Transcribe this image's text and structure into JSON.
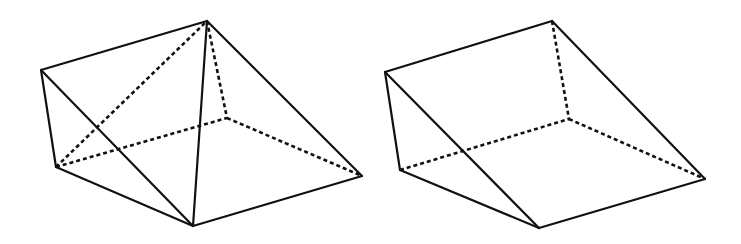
{
  "figures": [
    {
      "id": "left-solid",
      "description": "Triangular prism dissected by two diagonals",
      "vertices": {
        "A": [
          41,
          70
        ],
        "B": [
          207,
          21
        ],
        "C": [
          56,
          167
        ],
        "D": [
          193,
          226
        ],
        "E": [
          362,
          176
        ],
        "F": [
          227,
          118
        ]
      },
      "solid_edges": [
        [
          "A",
          "B"
        ],
        [
          "A",
          "C"
        ],
        [
          "A",
          "D"
        ],
        [
          "C",
          "D"
        ],
        [
          "B",
          "D"
        ],
        [
          "B",
          "E"
        ],
        [
          "D",
          "E"
        ]
      ],
      "hidden_edges": [
        [
          "C",
          "B"
        ],
        [
          "B",
          "F"
        ],
        [
          "C",
          "F"
        ],
        [
          "F",
          "E"
        ]
      ]
    },
    {
      "id": "right-solid",
      "description": "Triangular prism (wedge)",
      "vertices": {
        "A": [
          385,
          72
        ],
        "B": [
          552,
          21
        ],
        "C": [
          400,
          170
        ],
        "D": [
          539,
          228
        ],
        "E": [
          705,
          179
        ],
        "F": [
          569,
          119
        ]
      },
      "solid_edges": [
        [
          "A",
          "B"
        ],
        [
          "A",
          "C"
        ],
        [
          "A",
          "D"
        ],
        [
          "C",
          "D"
        ],
        [
          "B",
          "E"
        ],
        [
          "D",
          "E"
        ]
      ],
      "hidden_edges": [
        [
          "B",
          "F"
        ],
        [
          "C",
          "F"
        ],
        [
          "F",
          "E"
        ]
      ]
    }
  ],
  "style": {
    "stroke_color": "#111111",
    "background": "#ffffff"
  }
}
